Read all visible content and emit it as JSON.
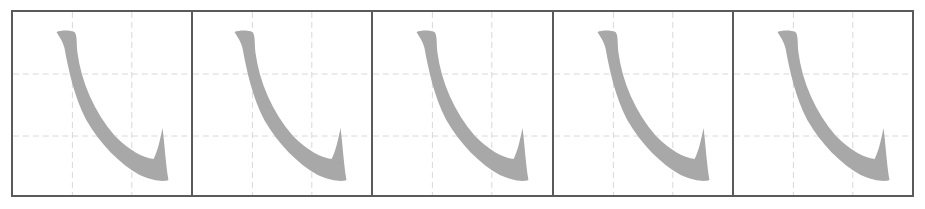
{
  "worksheet": {
    "title": "",
    "stroke_name": "wogou",
    "grid": {
      "cell_count": 5,
      "guide_style": "dashed-thirds",
      "border_color": "#5a5a5a",
      "guide_color": "#d8d8d8"
    },
    "stroke": {
      "color": "#a8a8a8",
      "icon": "stroke-hook-glyph"
    },
    "cells": [
      {
        "index": 1,
        "content": "stroke-hook-glyph"
      },
      {
        "index": 2,
        "content": "stroke-hook-glyph"
      },
      {
        "index": 3,
        "content": "stroke-hook-glyph"
      },
      {
        "index": 4,
        "content": "stroke-hook-glyph"
      },
      {
        "index": 5,
        "content": "stroke-hook-glyph"
      }
    ]
  }
}
